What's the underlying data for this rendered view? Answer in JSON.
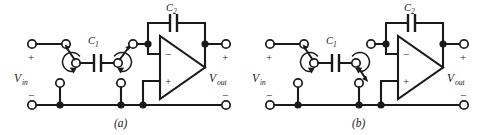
{
  "figure": {
    "type": "circuit-schematic",
    "background_color": "#ffffff",
    "line_color": "#1a1a1a",
    "panels": [
      {
        "id": "a",
        "caption": "(a)",
        "input_label": "V",
        "input_sub": "in",
        "output_label": "V",
        "output_sub": "out",
        "cap_series_label": "C",
        "cap_series_sub": "1",
        "cap_feedback_label": "C",
        "cap_feedback_sub": "2",
        "input_plus": "+",
        "input_minus": "−",
        "output_plus": "+",
        "output_minus": "−",
        "opamp_inverting": "−",
        "opamp_noninverting": "+",
        "switch_left_position": "up-to-input",
        "switch_right_position": "up-to-opamp"
      },
      {
        "id": "b",
        "caption": "(b)",
        "input_label": "V",
        "input_sub": "in",
        "output_label": "V",
        "output_sub": "out",
        "cap_series_label": "C",
        "cap_series_sub": "1",
        "cap_feedback_label": "C",
        "cap_feedback_sub": "2",
        "input_plus": "+",
        "input_minus": "−",
        "output_plus": "+",
        "output_minus": "−",
        "opamp_inverting": "−",
        "opamp_noninverting": "+",
        "switch_left_position": "up-to-input",
        "switch_right_position": "down-to-ground"
      }
    ]
  }
}
